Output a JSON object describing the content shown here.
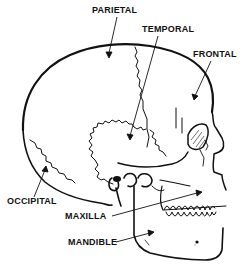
{
  "diagram": {
    "type": "anatomical-illustration",
    "labels": [
      {
        "id": "parietal",
        "text": "PARIETAL",
        "x": 92,
        "y": 13
      },
      {
        "id": "temporal",
        "text": "TEMPORAL",
        "x": 142,
        "y": 32
      },
      {
        "id": "frontal",
        "text": "FRONTAL",
        "x": 193,
        "y": 57
      },
      {
        "id": "occipital",
        "text": "OCCIPITAL",
        "x": 7,
        "y": 204
      },
      {
        "id": "maxilla",
        "text": "MAXILLA",
        "x": 65,
        "y": 219
      },
      {
        "id": "mandible",
        "text": "MANDIBLE",
        "x": 68,
        "y": 245
      }
    ],
    "colors": {
      "ink": "#111111",
      "background": "#ffffff"
    }
  }
}
